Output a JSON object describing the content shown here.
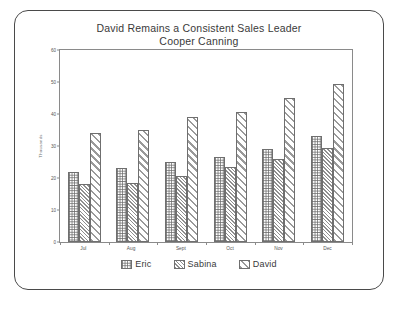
{
  "slide": {
    "title_line_1": "David Remains a Consistent Sales Leader",
    "title_line_2": "Cooper Canning"
  },
  "chart_data": {
    "type": "bar",
    "title": "David Remains a Consistent Sales Leader",
    "subtitle": "Cooper Canning",
    "xlabel": "",
    "ylabel": "Thousands",
    "categories": [
      "Jul",
      "Aug",
      "Sept",
      "Oct",
      "Nov",
      "Dec"
    ],
    "series": [
      {
        "name": "Eric",
        "values": [
          22,
          23,
          25,
          26.5,
          29,
          33
        ],
        "pattern": "checkerboard"
      },
      {
        "name": "Sabina",
        "values": [
          18,
          18.5,
          20.5,
          23.5,
          26,
          29.5
        ],
        "pattern": "dense-diagonal-hatch"
      },
      {
        "name": "David",
        "values": [
          34,
          35,
          39,
          40.5,
          45,
          49.5
        ],
        "pattern": "wide-diagonal-hatch"
      }
    ],
    "ylim": [
      0,
      60
    ],
    "yticks": [
      0,
      10,
      20,
      30,
      40,
      50,
      60
    ],
    "grid": false,
    "legend_position": "bottom"
  },
  "colors": {
    "frame_border": "#4a4a4a",
    "axis": "#8a8a8a",
    "bar_outline": "#6f6f6f",
    "text": "#3a3a3a",
    "tick_text": "#555555"
  }
}
